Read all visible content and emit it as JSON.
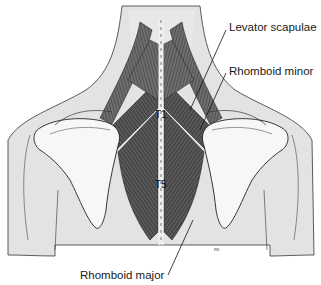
{
  "figure": {
    "colors": {
      "skin": "#e4e4e4",
      "bone": "#f7f7f7",
      "muscle_dark": "#3a3a3a",
      "muscle_mid": "#6a6a6a",
      "outline": "#222222",
      "background": "#ffffff"
    }
  },
  "labels": {
    "levator_scapulae": "Levator scapulae",
    "rhomboid_minor": "Rhomboid minor",
    "rhomboid_major": "Rhomboid major"
  },
  "vertebra_markers": {
    "t1": "T1",
    "t5": "T5"
  },
  "artist_initials": "RK"
}
